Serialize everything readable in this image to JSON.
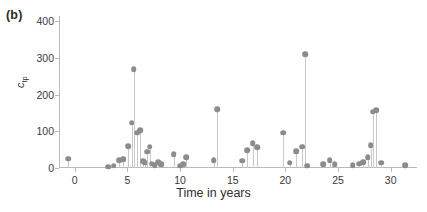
{
  "panel": {
    "label": "(b)"
  },
  "chart_data": {
    "type": "scatter",
    "subtype": "stem",
    "title": "",
    "panel_label": "(b)",
    "xlabel": "Time in years",
    "ylabel": "c_tp",
    "ylabel_base": "c",
    "ylabel_sub": "tp",
    "xlim": [
      -1.5,
      32.5
    ],
    "ylim": [
      0,
      415
    ],
    "yticks": [
      0,
      100,
      200,
      300,
      400
    ],
    "ytick_labels": [
      "0",
      "100",
      "200",
      "300",
      "400"
    ],
    "xticks": [
      0,
      5,
      10,
      15,
      20,
      25,
      30
    ],
    "xtick_labels": [
      "0",
      "5",
      "10",
      "15",
      "20",
      "25",
      "30"
    ],
    "grid": false,
    "legend": null,
    "marker_color": "#8c8c8c",
    "stem_color": "#c9c9c9",
    "axis_color": "#b9b9b9",
    "x": [
      -0.6,
      3.2,
      3.7,
      4.2,
      4.6,
      5.1,
      5.4,
      5.6,
      5.9,
      6.2,
      6.5,
      6.7,
      6.9,
      7.1,
      7.3,
      7.6,
      7.9,
      8.2,
      9.4,
      10.0,
      10.3,
      10.6,
      13.2,
      13.5,
      15.9,
      16.4,
      16.9,
      17.3,
      19.8,
      20.4,
      21.0,
      21.6,
      21.9,
      22.1,
      23.6,
      24.2,
      24.7,
      26.4,
      27.0,
      27.4,
      27.8,
      28.1,
      28.3,
      28.6,
      29.1,
      31.4
    ],
    "y": [
      25,
      4,
      6,
      22,
      24,
      60,
      124,
      270,
      96,
      104,
      18,
      14,
      44,
      58,
      12,
      8,
      16,
      10,
      38,
      6,
      10,
      30,
      22,
      160,
      20,
      48,
      68,
      56,
      96,
      14,
      46,
      58,
      310,
      6,
      10,
      22,
      10,
      8,
      12,
      16,
      30,
      62,
      154,
      158,
      14,
      8
    ],
    "n_points": 46,
    "y_max_point": {
      "x": 21.9,
      "y": 310
    }
  }
}
